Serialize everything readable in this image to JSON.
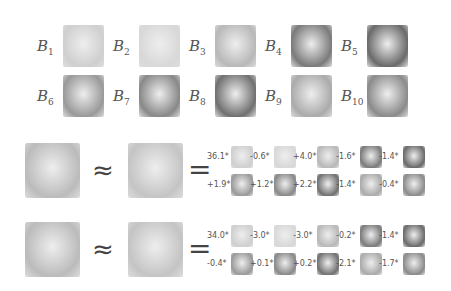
{
  "basis": [
    {
      "label": "B",
      "sub": "1"
    },
    {
      "label": "B",
      "sub": "2"
    },
    {
      "label": "B",
      "sub": "3"
    },
    {
      "label": "B",
      "sub": "4"
    },
    {
      "label": "B",
      "sub": "5"
    },
    {
      "label": "B",
      "sub": "6"
    },
    {
      "label": "B",
      "sub": "7"
    },
    {
      "label": "B",
      "sub": "8"
    },
    {
      "label": "B",
      "sub": "9"
    },
    {
      "label": "B",
      "sub": "10"
    }
  ],
  "symbols": {
    "approx": "≈",
    "equals": "="
  },
  "examples": [
    {
      "coefficients": [
        "36.1*",
        "-0.6*",
        "+4.0*",
        "-1.6*",
        "-1.4*",
        "+1.9*",
        "+1.2*",
        "+2.2*",
        "-1.4*",
        "-0.4*"
      ]
    },
    {
      "coefficients": [
        "34.0*",
        "-3.0*",
        "-3.0*",
        "-0.2*",
        "-1.4*",
        "-0.4*",
        "+0.1*",
        "+0.2*",
        "-2.1*",
        "-1.7*"
      ]
    }
  ]
}
